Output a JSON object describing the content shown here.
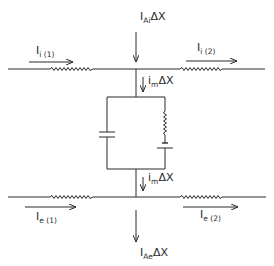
{
  "diagram": {
    "type": "circuit",
    "colors": {
      "line": "#2a2a2a",
      "background": "#ffffff"
    },
    "labels": {
      "top_current": {
        "main": "I",
        "sub": "Ai",
        "suffix": "ΔX"
      },
      "bottom_current": {
        "main": "I",
        "sub": "Ae",
        "suffix": "ΔX"
      },
      "intra_left": {
        "main": "I",
        "sub": "i (1)"
      },
      "intra_right": {
        "main": "I",
        "sub": "i (2)"
      },
      "extra_left": {
        "main": "I",
        "sub": "e (1)"
      },
      "extra_right": {
        "main": "I",
        "sub": "e (2)"
      },
      "membrane_upper": {
        "main": "i",
        "sub": "m",
        "suffix": "ΔX"
      },
      "membrane_lower": {
        "main": "i",
        "sub": "m",
        "suffix": "ΔX"
      }
    },
    "components": {
      "intracellular_line": [
        "resistor-left",
        "junction",
        "resistor-right"
      ],
      "extracellular_line": [
        "resistor-left",
        "junction",
        "resistor-right"
      ],
      "membrane_branch": {
        "left": "capacitor",
        "right": [
          "resistor",
          "battery"
        ]
      }
    }
  }
}
